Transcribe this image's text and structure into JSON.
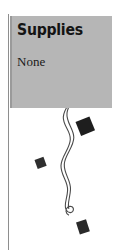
{
  "page": {
    "width": 117,
    "height": 250,
    "background_color": "#ffffff"
  },
  "margin_rule": {
    "color": "#8e8e8e"
  },
  "panel": {
    "background_color": "#b6b6b6",
    "edge_color": "#9a9a9a",
    "title": "Supplies",
    "body": "None"
  },
  "decorations": {
    "ink_color": "#2b2b2b",
    "vine_color": "#4a4a4a",
    "items": [
      {
        "name": "triangle-marker",
        "label": "solid right-pointing triangle"
      },
      {
        "name": "vine-flourish",
        "label": "wavy double-stroke vine with spiral curls"
      },
      {
        "name": "diamond-large",
        "label": "large tilted solid square"
      },
      {
        "name": "diamond-small-left",
        "label": "small tilted solid square"
      },
      {
        "name": "diamond-bottom",
        "label": "tilted solid square at vine terminus"
      }
    ]
  }
}
